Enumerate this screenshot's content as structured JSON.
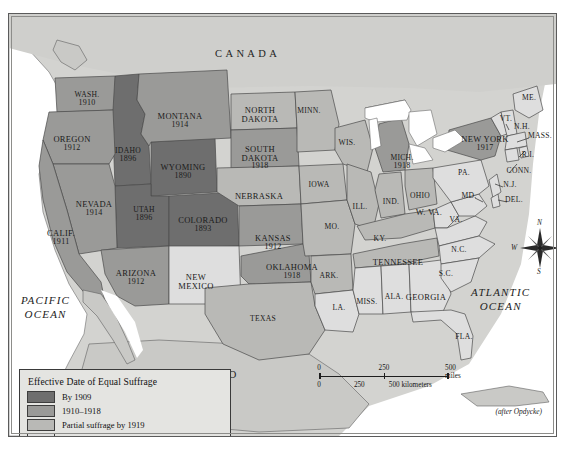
{
  "figure": {
    "title": "Effective Date of Equal Suffrage",
    "credit": "(after Opdycke)"
  },
  "countries": [
    {
      "name": "CANADA",
      "x": 214,
      "y": 41
    },
    {
      "name": "MEXICO",
      "x": 177,
      "y": 362
    }
  ],
  "oceans": [
    {
      "name": "PACIFIC",
      "name2": "OCEAN",
      "x": 20,
      "y": 286
    },
    {
      "name": "ATLANTIC",
      "name2": "OCEAN",
      "x": 470,
      "y": 278
    }
  ],
  "legend": {
    "title": "Effective Date of Equal Suffrage",
    "items": [
      {
        "label": "By 1909",
        "color": "#6e6e6e"
      },
      {
        "label": "1910–1918",
        "color": "#9a9a98"
      },
      {
        "label": "Partial suffrage by 1919",
        "color": "#b9b9b6"
      },
      {
        "label": "No woman suffrage by 1919",
        "color": "#dedede"
      }
    ]
  },
  "scale": {
    "miles": {
      "ticks": [
        "0",
        "250",
        "500 miles"
      ],
      "positions": [
        0,
        50,
        100
      ]
    },
    "kilometers": {
      "ticks": [
        "0",
        "250",
        "500 kilometers"
      ],
      "positions": [
        0,
        31,
        62
      ]
    }
  },
  "compass": {
    "n": "N",
    "e": "E",
    "s": "S",
    "w": "W"
  },
  "chart_data": {
    "type": "map",
    "title": "Effective Date of Equal Suffrage",
    "legend_categories": [
      "By 1909",
      "1910–1918",
      "Partial suffrage by 1919",
      "No woman suffrage by 1919"
    ],
    "colors": {
      "by1909": "#6e6e6e",
      "1910_1918": "#9a9a98",
      "partial": "#b9b9b6",
      "none": "#dedede"
    },
    "states": [
      {
        "name": "WASH.",
        "year": "1910",
        "category": "1910_1918",
        "x": 78,
        "y": 83
      },
      {
        "name": "OREGON",
        "year": "1912",
        "category": "1910_1918",
        "x": 63,
        "y": 127
      },
      {
        "name": "CALIF.",
        "year": "1911",
        "category": "1910_1918",
        "x": 52,
        "y": 221
      },
      {
        "name": "IDAHO",
        "year": "1896",
        "category": "by1909",
        "x": 119,
        "y": 139
      },
      {
        "name": "NEVADA",
        "year": "1914",
        "category": "1910_1918",
        "x": 85,
        "y": 192
      },
      {
        "name": "UTAH",
        "year": "1896",
        "category": "by1909",
        "x": 135,
        "y": 198
      },
      {
        "name": "MONTANA",
        "year": "1914",
        "category": "1910_1918",
        "x": 171,
        "y": 104
      },
      {
        "name": "WYOMING",
        "year": "1890",
        "category": "by1909",
        "x": 174,
        "y": 155
      },
      {
        "name": "COLORADO",
        "year": "1893",
        "category": "by1909",
        "x": 194,
        "y": 208
      },
      {
        "name": "ARIZONA",
        "year": "1912",
        "category": "1910_1918",
        "x": 127,
        "y": 261
      },
      {
        "name": "NEW MEXICO",
        "year": "",
        "category": "none",
        "x": 187,
        "y": 265
      },
      {
        "name": "NORTH DAKOTA",
        "year": "",
        "category": "partial",
        "x": 251,
        "y": 98
      },
      {
        "name": "SOUTH DAKOTA",
        "year": "1918",
        "category": "1910_1918",
        "x": 251,
        "y": 137
      },
      {
        "name": "NEBRASKA",
        "year": "",
        "category": "partial",
        "x": 250,
        "y": 184
      },
      {
        "name": "KANSAS",
        "year": "1912",
        "category": "1910_1918",
        "x": 264,
        "y": 226
      },
      {
        "name": "OKLAHOMA",
        "year": "1918",
        "category": "1910_1918",
        "x": 283,
        "y": 255
      },
      {
        "name": "TEXAS",
        "year": "",
        "category": "partial",
        "x": 254,
        "y": 307
      },
      {
        "name": "MINN.",
        "year": "",
        "category": "partial",
        "x": 300,
        "y": 99
      },
      {
        "name": "IOWA",
        "year": "",
        "category": "partial",
        "x": 310,
        "y": 173
      },
      {
        "name": "MO.",
        "year": "",
        "category": "partial",
        "x": 323,
        "y": 215
      },
      {
        "name": "ARK.",
        "year": "",
        "category": "partial",
        "x": 320,
        "y": 264
      },
      {
        "name": "LA.",
        "year": "",
        "category": "none",
        "x": 330,
        "y": 296
      },
      {
        "name": "WIS.",
        "year": "",
        "category": "partial",
        "x": 338,
        "y": 131
      },
      {
        "name": "ILL.",
        "year": "",
        "category": "partial",
        "x": 351,
        "y": 195
      },
      {
        "name": "IND.",
        "year": "",
        "category": "partial",
        "x": 382,
        "y": 190
      },
      {
        "name": "MICH.",
        "year": "1918",
        "category": "1910_1918",
        "x": 393,
        "y": 146
      },
      {
        "name": "OHIO",
        "year": "",
        "category": "partial",
        "x": 411,
        "y": 184
      },
      {
        "name": "KY.",
        "year": "",
        "category": "partial",
        "x": 371,
        "y": 227
      },
      {
        "name": "TENNESSEE",
        "year": "",
        "category": "partial",
        "x": 389,
        "y": 250
      },
      {
        "name": "MISS.",
        "year": "",
        "category": "none",
        "x": 358,
        "y": 290
      },
      {
        "name": "ALA.",
        "year": "",
        "category": "none",
        "x": 385,
        "y": 285
      },
      {
        "name": "GEORGIA",
        "year": "",
        "category": "none",
        "x": 417,
        "y": 285
      },
      {
        "name": "FLA.",
        "year": "",
        "category": "none",
        "x": 455,
        "y": 325
      },
      {
        "name": "S.C.",
        "year": "",
        "category": "none",
        "x": 437,
        "y": 262
      },
      {
        "name": "N.C.",
        "year": "",
        "category": "none",
        "x": 450,
        "y": 238
      },
      {
        "name": "VA.",
        "year": "",
        "category": "none",
        "x": 447,
        "y": 208
      },
      {
        "name": "W. VA.",
        "year": "",
        "category": "none",
        "x": 420,
        "y": 200
      },
      {
        "name": "MD.",
        "year": "",
        "category": "none",
        "x": 460,
        "y": 184
      },
      {
        "name": "DEL.",
        "year": "",
        "category": "none",
        "x": 505,
        "y": 188
      },
      {
        "name": "N.J.",
        "year": "",
        "category": "none",
        "x": 501,
        "y": 173
      },
      {
        "name": "PA.",
        "year": "",
        "category": "none",
        "x": 455,
        "y": 161
      },
      {
        "name": "NEW YORK",
        "year": "1917",
        "category": "1910_1918",
        "x": 476,
        "y": 127
      },
      {
        "name": "CONN.",
        "year": "",
        "category": "none",
        "x": 510,
        "y": 159
      },
      {
        "name": "R.I.",
        "year": "",
        "category": "none",
        "x": 519,
        "y": 143
      },
      {
        "name": "MASS.",
        "year": "",
        "category": "none",
        "x": 531,
        "y": 124
      },
      {
        "name": "N.H.",
        "year": "",
        "category": "none",
        "x": 513,
        "y": 115
      },
      {
        "name": "VT.",
        "year": "",
        "category": "none",
        "x": 497,
        "y": 107
      },
      {
        "name": "ME.",
        "year": "",
        "category": "none",
        "x": 520,
        "y": 86
      }
    ]
  }
}
